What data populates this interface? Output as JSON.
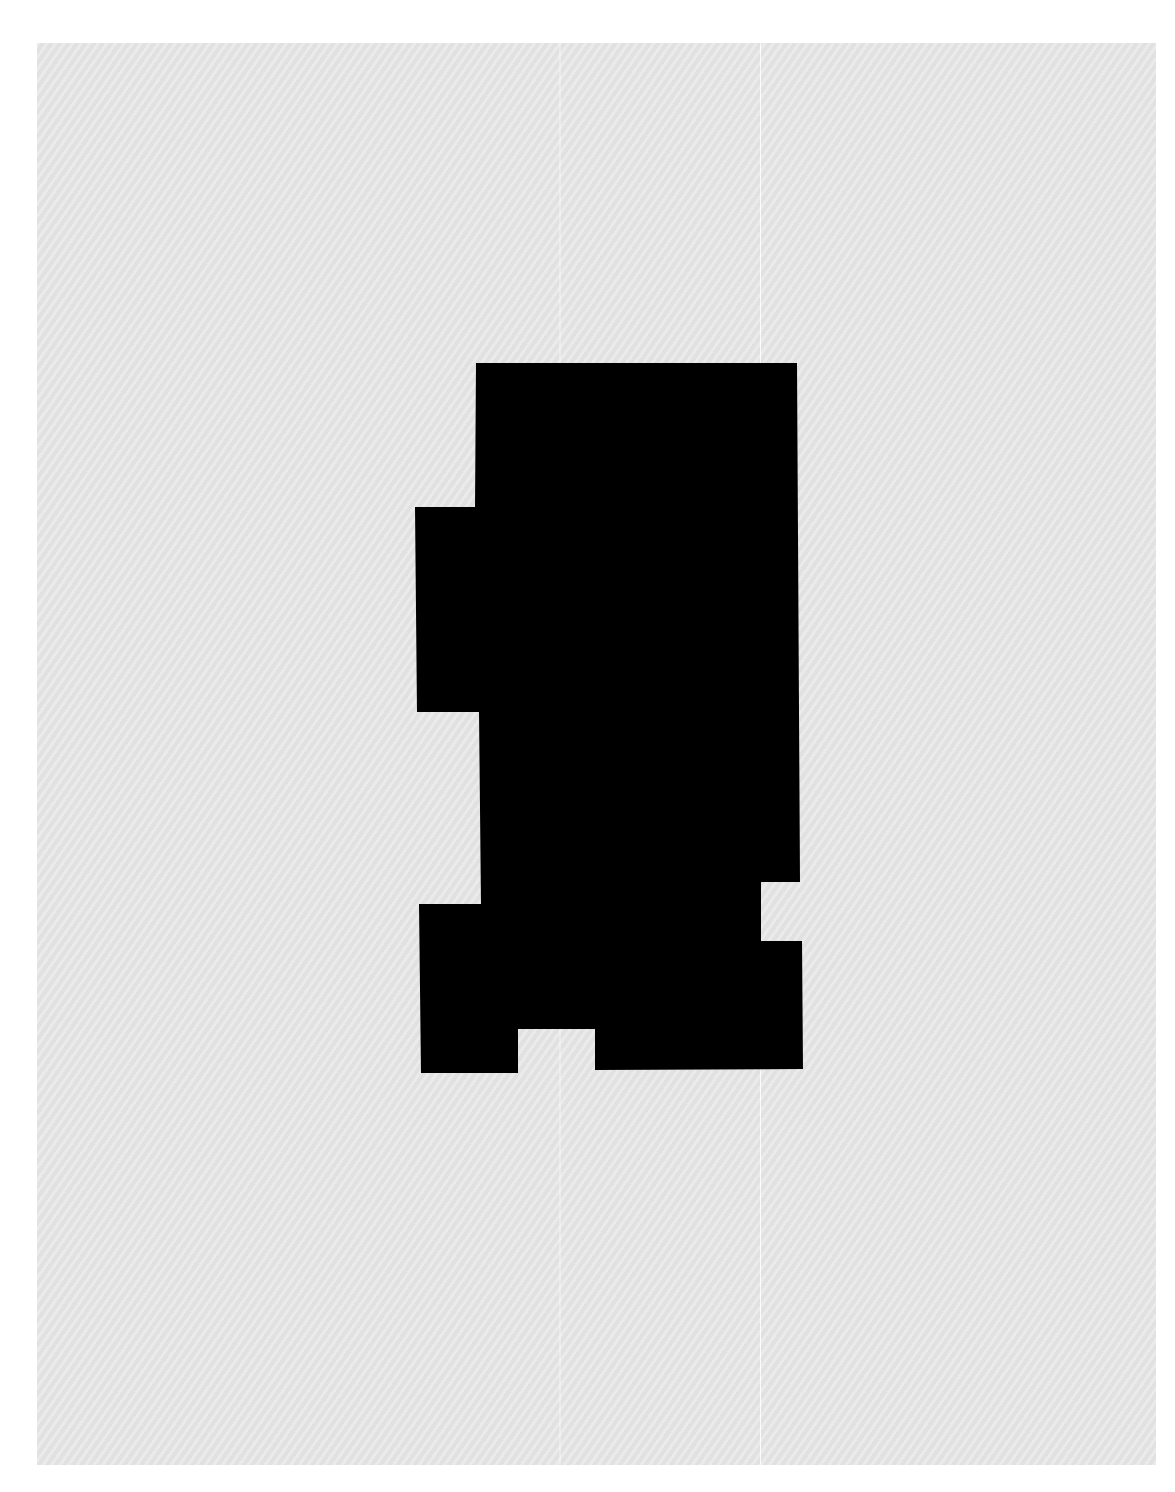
{
  "document": {
    "type": "scanned-page",
    "background_color": "#e6e6e6",
    "outer_color": "#ffffff",
    "text": []
  },
  "redaction": {
    "label": "redacted-block",
    "fill": "#000000",
    "points": "476,363 797,363 800,882 761,882 761,941 802,941 803,1069 595,1070 595,1029 518,1029 518,1073 421,1073 419,904 481,904 479,712 417,712 415,507 475,507"
  }
}
